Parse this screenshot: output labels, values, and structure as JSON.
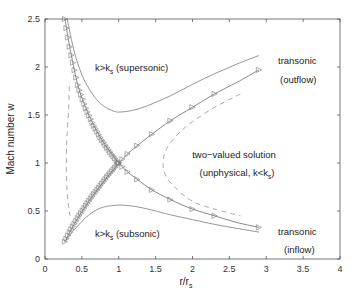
{
  "chart_data": {
    "type": "line",
    "title": "",
    "xlabel": "r/r_s",
    "ylabel": "Mach number w",
    "xlim": [
      0,
      4
    ],
    "ylim": [
      0,
      2.5
    ],
    "xticks": [
      "0",
      "0.5",
      "1",
      "1.5",
      "2",
      "2.5",
      "3",
      "3.5",
      "4"
    ],
    "yticks": [
      "0",
      "0.5",
      "1",
      "1.5",
      "2",
      "2.5"
    ],
    "grid": false,
    "legend": null,
    "series": [
      {
        "name": "transonic (outflow)",
        "style": "solid-with-triangle-markers",
        "x": [
          0.27,
          0.35,
          0.45,
          0.55,
          0.65,
          0.75,
          0.85,
          0.95,
          1.0,
          1.1,
          1.25,
          1.45,
          1.7,
          2.0,
          2.3,
          2.6,
          2.9
        ],
        "y": [
          0.18,
          0.3,
          0.43,
          0.55,
          0.66,
          0.76,
          0.86,
          0.95,
          1.0,
          1.08,
          1.18,
          1.3,
          1.44,
          1.58,
          1.72,
          1.84,
          1.97
        ]
      },
      {
        "name": "transonic (inflow)",
        "style": "solid-with-triangle-markers",
        "x": [
          0.27,
          0.35,
          0.45,
          0.55,
          0.65,
          0.75,
          0.85,
          0.95,
          1.0,
          1.1,
          1.25,
          1.45,
          1.7,
          2.0,
          2.3,
          2.6,
          2.9
        ],
        "y": [
          2.5,
          2.15,
          1.8,
          1.58,
          1.41,
          1.27,
          1.15,
          1.05,
          1.0,
          0.92,
          0.83,
          0.72,
          0.62,
          0.52,
          0.45,
          0.38,
          0.33
        ]
      },
      {
        "name": "k>k_s (supersonic)",
        "style": "solid",
        "x": [
          0.3,
          0.4,
          0.5,
          0.6,
          0.7,
          0.8,
          0.9,
          1.0,
          1.2,
          1.4,
          1.7,
          2.0,
          2.3,
          2.6,
          2.9
        ],
        "y": [
          2.5,
          2.15,
          1.92,
          1.77,
          1.66,
          1.59,
          1.55,
          1.53,
          1.55,
          1.6,
          1.7,
          1.82,
          1.93,
          2.03,
          2.12
        ]
      },
      {
        "name": "k>k_s (subsonic)",
        "style": "solid",
        "x": [
          0.27,
          0.35,
          0.45,
          0.55,
          0.65,
          0.75,
          0.85,
          1.0,
          1.2,
          1.45,
          1.7,
          2.0,
          2.3,
          2.6,
          2.9
        ],
        "y": [
          0.18,
          0.26,
          0.35,
          0.43,
          0.49,
          0.53,
          0.55,
          0.56,
          0.55,
          0.51,
          0.46,
          0.41,
          0.36,
          0.32,
          0.28
        ]
      },
      {
        "name": "two-valued solution left branch (unphysical, k<k_s)",
        "style": "dashed",
        "x": [
          0.33,
          0.32,
          0.3,
          0.29,
          0.29,
          0.3,
          0.32,
          0.34
        ],
        "y": [
          1.8,
          1.55,
          1.3,
          1.1,
          0.9,
          0.7,
          0.55,
          0.45
        ]
      },
      {
        "name": "two-valued solution right branch (unphysical, k<k_s)",
        "style": "dashed",
        "x": [
          2.65,
          2.3,
          2.0,
          1.8,
          1.65,
          1.6,
          1.65,
          1.8,
          2.0,
          2.3,
          2.65
        ],
        "y": [
          1.72,
          1.58,
          1.43,
          1.3,
          1.15,
          1.0,
          0.85,
          0.72,
          0.6,
          0.52,
          0.45
        ]
      }
    ],
    "annotations": [
      {
        "text": "k>k",
        "sub": "s",
        "suffix": " (supersonic)",
        "x": 1.2,
        "y": 2.0
      },
      {
        "text": "transonic",
        "x": 3.25,
        "y": 2.05
      },
      {
        "text": "(outflow)",
        "x": 3.25,
        "y": 1.85
      },
      {
        "text": "two−valued solution",
        "x": 2.6,
        "y": 1.05
      },
      {
        "text": "(unphysical, k<k",
        "sub": "s",
        "suffix": ")",
        "x": 2.7,
        "y": 0.87
      },
      {
        "text": "k>k",
        "sub": "s",
        "suffix": " (subsonic)",
        "x": 1.2,
        "y": 0.25
      },
      {
        "text": "transonic",
        "x": 3.25,
        "y": 0.38
      },
      {
        "text": "(inflow)",
        "x": 3.25,
        "y": 0.18
      }
    ]
  },
  "labels": {
    "xlabel_main": "r/r",
    "xlabel_sub": "s",
    "ylabel": "Mach number w",
    "supersonic_main": "k>k",
    "supersonic_sub": "s",
    "supersonic_suffix": " (supersonic)",
    "subsonic_main": "k>k",
    "subsonic_sub": "s",
    "subsonic_suffix": " (subsonic)",
    "transonic_out_1": "transonic",
    "transonic_out_2": "(outflow)",
    "transonic_in_1": "transonic",
    "transonic_in_2": "(inflow)",
    "two_valued_1": "two−valued solution",
    "two_valued_2_main": "(unphysical, k<k",
    "two_valued_2_sub": "s",
    "two_valued_2_suffix": ")"
  },
  "colors": {
    "axis": "#555555",
    "solid_line": "#8a8a8a",
    "marker_line": "#7a7a7a",
    "dashed_line": "#a0a0a0",
    "text": "#222222"
  }
}
